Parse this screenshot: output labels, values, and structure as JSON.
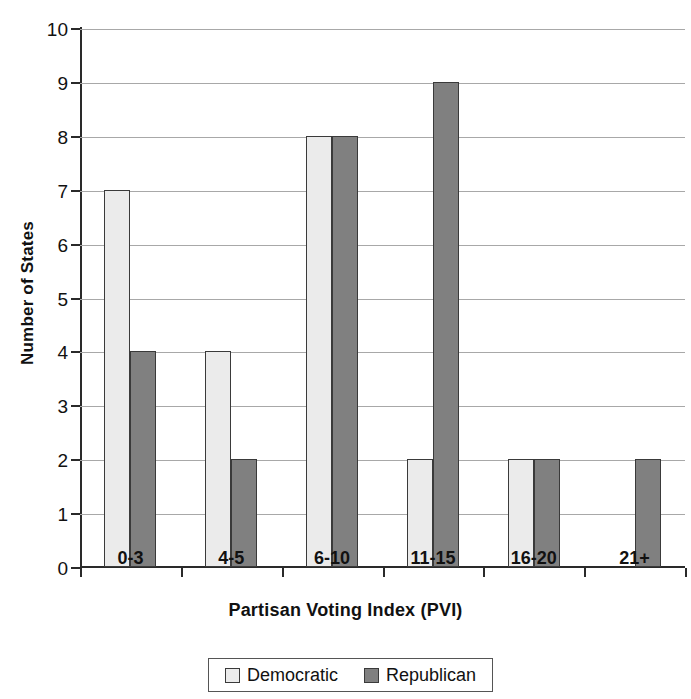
{
  "chart_data": {
    "type": "bar",
    "title": "",
    "xlabel": "Partisan Voting Index (PVI)",
    "ylabel": "Number of States",
    "categories": [
      "0-3",
      "4-5",
      "6-10",
      "11-15",
      "16-20",
      "21+"
    ],
    "series": [
      {
        "name": "Democratic",
        "color": "#ebebeb",
        "values": [
          7,
          4,
          8,
          2,
          2,
          0
        ]
      },
      {
        "name": "Republican",
        "color": "#808080",
        "values": [
          4,
          2,
          8,
          9,
          2,
          2
        ]
      }
    ],
    "ylim": [
      0,
      10
    ],
    "yticks": [
      0,
      1,
      2,
      3,
      4,
      5,
      6,
      7,
      8,
      9,
      10
    ],
    "ytick_labels": [
      "0",
      "1",
      "2",
      "3",
      "4",
      "5",
      "6",
      "7",
      "8",
      "9",
      "10"
    ],
    "grid": true,
    "grid_axis": "y",
    "legend_position": "bottom",
    "legend_entries": [
      "Democratic",
      "Republican"
    ]
  },
  "axes": {
    "y_title": "Number of States",
    "x_title": "Partisan Voting Index (PVI)"
  },
  "legend": {
    "items": [
      {
        "label": "Democratic"
      },
      {
        "label": "Republican"
      }
    ]
  }
}
